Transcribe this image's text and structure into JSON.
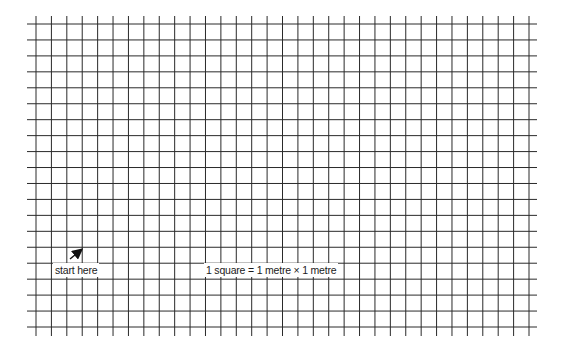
{
  "diagram": {
    "type": "square grid",
    "columns": 32,
    "rows": 19,
    "line_color": "#2a2a2a",
    "background": "#ffffff",
    "start_label": "start here",
    "scale_label": "1 square = 1 metre × 1 metre",
    "arrow": {
      "direction": "up-right",
      "icon": "arrow-icon"
    }
  }
}
